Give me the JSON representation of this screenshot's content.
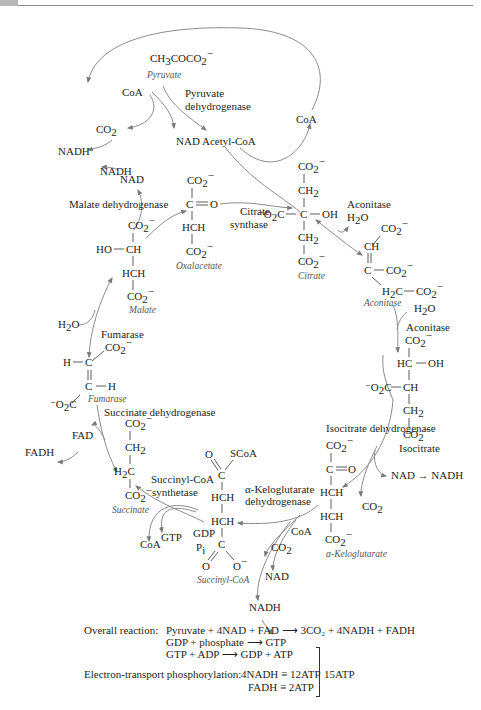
{
  "diagram": {
    "colors": {
      "text": "#231f20",
      "arrow": "#8c8c8c",
      "label_italic": "#555555"
    },
    "pyruvate": {
      "formula": "CH3COCO2−",
      "name": "Pyruvate",
      "enzyme_line1": "Pyruvate",
      "enzyme_line2": "dehydrogenase"
    },
    "pyruvate_step": {
      "coa_in": "CoA",
      "co2_out": "CO2",
      "nad": "NAD",
      "nadh": "NADH",
      "product": "Acetyl-CoA",
      "coa_recycled": "CoA"
    },
    "oxalacetate": {
      "name": "Oxalacetate",
      "atoms": [
        "CO2−",
        "C",
        "O",
        "HCH",
        "CO2−"
      ]
    },
    "malate_dehydrogenase": {
      "enzyme": "Malate dehydrogenase",
      "nad": "NAD",
      "nadh": "NADH"
    },
    "malate": {
      "name": "Malate",
      "atoms": [
        "CO2−",
        "HO",
        "CH",
        "HCH",
        "CO2−"
      ]
    },
    "citrate_synthase": {
      "line1": "Citrate",
      "line2": "synthase"
    },
    "citrate": {
      "name": "Citrate",
      "atoms": [
        "CO2−",
        "CH2",
        "−O2C",
        "C",
        "OH",
        "CH2",
        "CO2−"
      ]
    },
    "aconitase_1": {
      "enzyme": "Aconitase",
      "h2o": "H2O"
    },
    "aconitate": {
      "name": "Aconitase",
      "atoms": [
        "CO2−",
        "CH",
        "C",
        "CO2−",
        "H2C",
        "CO2−"
      ]
    },
    "aconitase_2": {
      "enzyme": "Aconitase",
      "h2o": "H2O"
    },
    "isocitrate": {
      "name": "Isocitrate",
      "atoms": [
        "CO2−",
        "HC",
        "OH",
        "−O2C",
        "CH",
        "CH2",
        "CO2−"
      ]
    },
    "isocitrate_dehydrogenase": {
      "enzyme": "Isocitrate dehydrogenase",
      "nad_to_nadh": "NAD → NADH",
      "co2": "CO2"
    },
    "alpha_ketoglutarate": {
      "name": "α-Keloglutarate",
      "atoms": [
        "CO2−",
        "C",
        "O",
        "HCH",
        "HCH",
        "CO2−"
      ]
    },
    "alpha_kg_dehydrogenase": {
      "line1": "α-Keloglutarate",
      "line2": "dehydrogenase",
      "coa": "CoA",
      "co2": "CO2",
      "nad": "NAD",
      "nadh": "NADH"
    },
    "succinyl_coa": {
      "name": "Succinyl-CoA",
      "atoms": [
        "O",
        "SCoA",
        "C",
        "HCH",
        "HCH",
        "C",
        "O",
        "O−"
      ]
    },
    "succinyl_coa_synthetase": {
      "line1": "Succinyl-CoA",
      "line2": "synthetase",
      "gdp": "GDP",
      "pi": "Pi",
      "gtp": "GTP",
      "coa": "CoA"
    },
    "succinate": {
      "name": "Succinate",
      "atoms": [
        "CO2−",
        "CH2",
        "H2C",
        "CO2−"
      ]
    },
    "succinate_dehydrogenase": {
      "enzyme": "Succinate dehydrogenase",
      "fad": "FAD",
      "fadh": "FADH"
    },
    "fumarate": {
      "name": "Fumarase",
      "atoms": [
        "CO2−",
        "H",
        "C",
        "C",
        "H",
        "−O2C"
      ]
    },
    "fumarase": {
      "enzyme": "Fumarase",
      "h2o": "H2O"
    }
  },
  "summary": {
    "overall_label": "Overall reaction:",
    "overall_lines": [
      "Pyruvate + 4NAD + FAD ⟶ 3CO₂ + 4NADH + FADH",
      "GDP + phosphate ⟶ GTP",
      "GTP + ADP ⟶ GDP + ATP"
    ],
    "et_label": "Electron-transport phosphorylation:",
    "et_lines": [
      "4NADH ≡ 12ATP",
      "FADH ≡ 2ATP"
    ],
    "total": "15ATP"
  }
}
